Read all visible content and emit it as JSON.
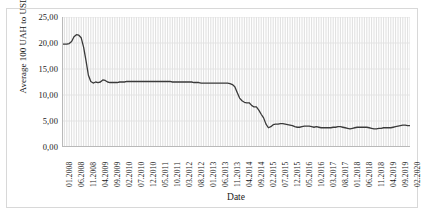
{
  "chart_data": {
    "type": "line",
    "title": "",
    "xlabel": "Date",
    "ylabel": "Average 100 UAH to USD",
    "grid": "vertical-monthly-and-horizontal-major",
    "legend": "none",
    "line_color": "#3a3a3a",
    "ylim": [
      0,
      25
    ],
    "ytick_labels": [
      "25,00",
      "20,00",
      "15,00",
      "10,00",
      "5,00",
      "0,00"
    ],
    "ytick_values": [
      25,
      20,
      15,
      10,
      5,
      0
    ],
    "xtick_labels": [
      "01.2008",
      "06.2008",
      "11.2008",
      "04.2009",
      "09.2009",
      "02.2010",
      "07.2010",
      "12.2010",
      "05.2011",
      "10.2011",
      "03.2012",
      "08.2012",
      "01.2013",
      "06.2013",
      "11.2013",
      "04.2014",
      "09.2014",
      "02.2015",
      "07.2015",
      "12.2015",
      "05.2016",
      "10.2016",
      "03.2017",
      "08.2017",
      "01.2018",
      "06.2018",
      "11.2018",
      "04.2019",
      "09.2019",
      "02.2020"
    ],
    "x_start": "01.2008",
    "x_end": "02.2020",
    "x_tick_step_months": 5,
    "series": [
      {
        "name": "Average 100 UAH to USD",
        "x": [
          "01.2008",
          "02.2008",
          "03.2008",
          "04.2008",
          "05.2008",
          "06.2008",
          "07.2008",
          "08.2008",
          "09.2008",
          "10.2008",
          "11.2008",
          "12.2008",
          "01.2009",
          "02.2009",
          "03.2009",
          "04.2009",
          "05.2009",
          "06.2009",
          "07.2009",
          "08.2009",
          "09.2009",
          "10.2009",
          "11.2009",
          "12.2009",
          "01.2010",
          "02.2010",
          "03.2010",
          "04.2010",
          "05.2010",
          "06.2010",
          "07.2010",
          "08.2010",
          "09.2010",
          "10.2010",
          "11.2010",
          "12.2010",
          "01.2011",
          "02.2011",
          "03.2011",
          "04.2011",
          "05.2011",
          "06.2011",
          "07.2011",
          "08.2011",
          "09.2011",
          "10.2011",
          "11.2011",
          "12.2011",
          "01.2012",
          "02.2012",
          "03.2012",
          "04.2012",
          "05.2012",
          "06.2012",
          "07.2012",
          "08.2012",
          "09.2012",
          "10.2012",
          "11.2012",
          "12.2012",
          "01.2013",
          "02.2013",
          "03.2013",
          "04.2013",
          "05.2013",
          "06.2013",
          "07.2013",
          "08.2013",
          "09.2013",
          "10.2013",
          "11.2013",
          "12.2013",
          "01.2014",
          "02.2014",
          "03.2014",
          "04.2014",
          "05.2014",
          "06.2014",
          "07.2014",
          "08.2014",
          "09.2014",
          "10.2014",
          "11.2014",
          "12.2014",
          "01.2015",
          "02.2015",
          "03.2015",
          "04.2015",
          "05.2015",
          "06.2015",
          "07.2015",
          "08.2015",
          "09.2015",
          "10.2015",
          "11.2015",
          "12.2015",
          "01.2016",
          "02.2016",
          "03.2016",
          "04.2016",
          "05.2016",
          "06.2016",
          "07.2016",
          "08.2016",
          "09.2016",
          "10.2016",
          "11.2016",
          "12.2016",
          "01.2017",
          "02.2017",
          "03.2017",
          "04.2017",
          "05.2017",
          "06.2017",
          "07.2017",
          "08.2017",
          "09.2017",
          "10.2017",
          "11.2017",
          "12.2017",
          "01.2018",
          "02.2018",
          "03.2018",
          "04.2018",
          "05.2018",
          "06.2018",
          "07.2018",
          "08.2018",
          "09.2018",
          "10.2018",
          "11.2018",
          "12.2018",
          "01.2019",
          "02.2019",
          "03.2019",
          "04.2019",
          "05.2019",
          "06.2019",
          "07.2019",
          "08.2019",
          "09.2019",
          "10.2019",
          "11.2019",
          "12.2019",
          "01.2020",
          "02.2020"
        ],
        "values": [
          19.8,
          19.8,
          19.8,
          19.9,
          20.3,
          21.2,
          21.6,
          21.5,
          21.0,
          19.2,
          16.6,
          13.8,
          12.6,
          12.3,
          12.5,
          12.4,
          12.5,
          12.9,
          12.8,
          12.5,
          12.4,
          12.4,
          12.4,
          12.4,
          12.5,
          12.5,
          12.5,
          12.6,
          12.6,
          12.6,
          12.6,
          12.6,
          12.6,
          12.6,
          12.6,
          12.6,
          12.6,
          12.6,
          12.6,
          12.6,
          12.6,
          12.6,
          12.6,
          12.6,
          12.6,
          12.6,
          12.5,
          12.5,
          12.5,
          12.5,
          12.5,
          12.5,
          12.5,
          12.5,
          12.5,
          12.4,
          12.4,
          12.4,
          12.3,
          12.3,
          12.3,
          12.3,
          12.3,
          12.3,
          12.3,
          12.3,
          12.3,
          12.3,
          12.3,
          12.3,
          12.2,
          12.0,
          11.6,
          10.5,
          9.4,
          8.9,
          8.6,
          8.5,
          8.5,
          8.0,
          7.7,
          7.7,
          7.1,
          6.3,
          5.6,
          4.4,
          3.7,
          3.9,
          4.3,
          4.4,
          4.4,
          4.5,
          4.5,
          4.4,
          4.3,
          4.2,
          4.1,
          3.9,
          3.8,
          3.8,
          3.9,
          4.0,
          4.0,
          4.0,
          3.9,
          3.8,
          3.9,
          3.8,
          3.7,
          3.7,
          3.7,
          3.7,
          3.7,
          3.8,
          3.8,
          3.9,
          3.9,
          3.8,
          3.7,
          3.6,
          3.5,
          3.6,
          3.7,
          3.8,
          3.8,
          3.8,
          3.8,
          3.8,
          3.7,
          3.6,
          3.5,
          3.5,
          3.6,
          3.6,
          3.7,
          3.7,
          3.7,
          3.7,
          3.8,
          3.9,
          4.0,
          4.1,
          4.2,
          4.2,
          4.1,
          4.1
        ]
      }
    ]
  }
}
